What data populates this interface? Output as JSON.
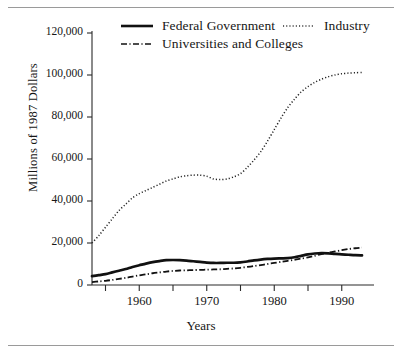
{
  "chart_data": {
    "type": "line",
    "title": "",
    "xlabel": "Years",
    "ylabel": "Millions of 1987 Dollars",
    "xlim": [
      1953,
      1993
    ],
    "ylim": [
      0,
      120000
    ],
    "grid": false,
    "legend_position": "top",
    "ytick_labels": [
      "0",
      "20,000",
      "40,000",
      "60,000",
      "80,000",
      "100,000",
      "120,000"
    ],
    "ytick_values": [
      0,
      20000,
      40000,
      60000,
      80000,
      100000,
      120000
    ],
    "xtick_values": [
      1955,
      1960,
      1965,
      1970,
      1975,
      1980,
      1985,
      1990
    ],
    "xtick_labels": [
      "",
      "1960",
      "",
      "1970",
      "",
      "1980",
      "",
      "1990"
    ],
    "x": [
      1953,
      1954,
      1955,
      1956,
      1957,
      1958,
      1959,
      1960,
      1961,
      1962,
      1963,
      1964,
      1965,
      1966,
      1967,
      1968,
      1969,
      1970,
      1971,
      1972,
      1973,
      1974,
      1975,
      1976,
      1977,
      1978,
      1979,
      1980,
      1981,
      1982,
      1983,
      1984,
      1985,
      1986,
      1987,
      1988,
      1989,
      1990,
      1991,
      1992,
      1993
    ],
    "series": [
      {
        "name": "Federal Government",
        "style": "solid",
        "color": "#111111",
        "values": [
          4200,
          4700,
          5200,
          6000,
          6800,
          7600,
          8600,
          9400,
          10200,
          10900,
          11400,
          11800,
          11900,
          11800,
          11600,
          11300,
          11000,
          10700,
          10500,
          10500,
          10600,
          10600,
          10800,
          11200,
          11700,
          12100,
          12400,
          12600,
          12700,
          12800,
          13200,
          13900,
          14600,
          15000,
          15200,
          15100,
          14800,
          14600,
          14400,
          14200,
          14100
        ]
      },
      {
        "name": "Industry",
        "style": "dotted",
        "color": "#222222",
        "values": [
          20000,
          23500,
          27500,
          31500,
          35500,
          38500,
          41500,
          43500,
          45000,
          46500,
          48000,
          49500,
          50500,
          51500,
          52000,
          52300,
          52300,
          51800,
          50500,
          50200,
          50500,
          51500,
          53000,
          56000,
          59500,
          63500,
          68500,
          74000,
          79500,
          84500,
          88500,
          92000,
          94500,
          96500,
          98000,
          99200,
          100000,
          100600,
          100900,
          101100,
          101200
        ]
      },
      {
        "name": "Universities and Colleges",
        "style": "dashdot",
        "color": "#111111",
        "values": [
          1400,
          1700,
          2000,
          2400,
          2900,
          3400,
          4000,
          4600,
          5100,
          5600,
          6000,
          6400,
          6700,
          6900,
          7000,
          7100,
          7200,
          7300,
          7400,
          7500,
          7700,
          7900,
          8200,
          8600,
          9000,
          9500,
          10000,
          10500,
          11000,
          11500,
          12000,
          12600,
          13200,
          13900,
          14700,
          15400,
          16000,
          16600,
          17100,
          17500,
          17800
        ]
      }
    ]
  },
  "legend": {
    "items": [
      {
        "label": "Federal Government",
        "style": "solid"
      },
      {
        "label": "Industry",
        "style": "dotted"
      },
      {
        "label": "Universities and Colleges",
        "style": "dashdot"
      }
    ]
  }
}
